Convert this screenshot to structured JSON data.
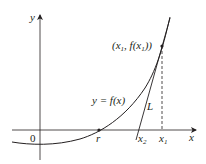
{
  "diagram": {
    "axes": {
      "x_label": "x",
      "y_label": "y",
      "origin_label": "0"
    },
    "curve": {
      "label": "y = f(x)",
      "label_parts": {
        "lhs": "y",
        "eq": " = ",
        "f": "f",
        "open": "(",
        "x": "x",
        "close": ")"
      }
    },
    "points": {
      "root": {
        "label": "r"
      },
      "x1": {
        "label": "x",
        "subscript": "1"
      },
      "x2": {
        "label": "x",
        "subscript": "2"
      },
      "tangent_point": {
        "label": "(x1, f(x1))",
        "parts": {
          "open": "(",
          "x": "x",
          "sub1": "1",
          "comma": ", ",
          "f": "f",
          "open2": "(",
          "x2": "x",
          "sub2": "1",
          "close": "))"
        }
      }
    },
    "tangent_line": {
      "label": "L"
    },
    "colors": {
      "ink": "#231f20",
      "background": "#ffffff"
    }
  }
}
